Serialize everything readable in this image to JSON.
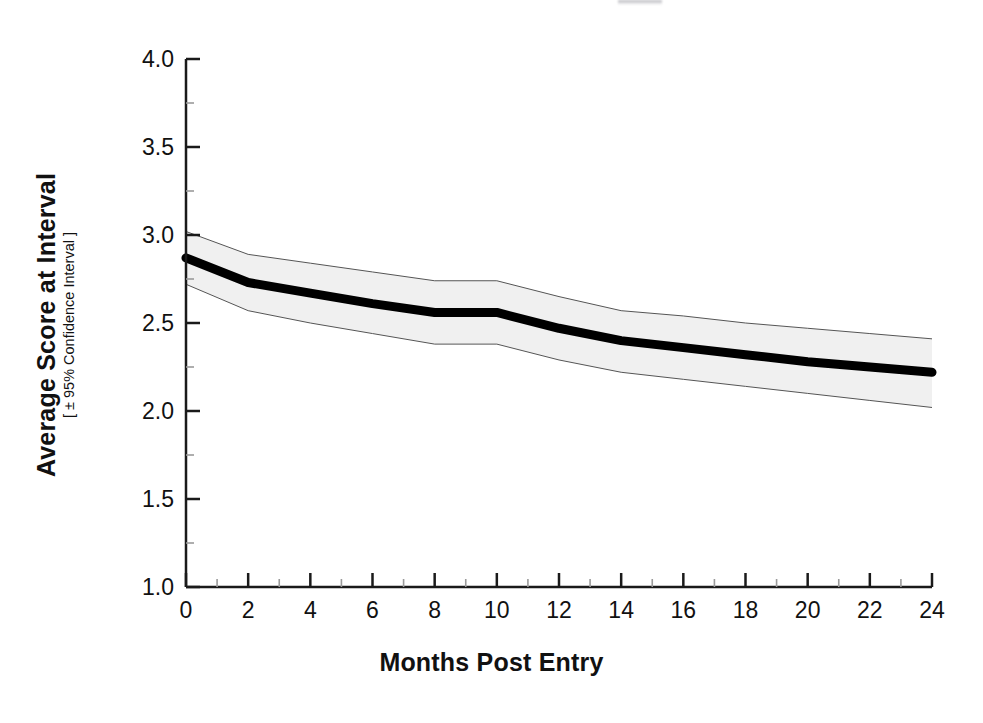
{
  "chart_data": {
    "type": "line",
    "title": "",
    "xlabel": "Months Post Entry",
    "ylabel": "Average Score at Interval",
    "ylabel_sub": "[ ± 95% Confidence Interval ]",
    "xlim": [
      0,
      24
    ],
    "ylim": [
      1.0,
      4.0
    ],
    "xticks": [
      0,
      2,
      4,
      6,
      8,
      10,
      12,
      14,
      16,
      18,
      20,
      22,
      24
    ],
    "xtick_labels": [
      "0",
      "2",
      "4",
      "6",
      "8",
      "10",
      "12",
      "14",
      "16",
      "18",
      "20",
      "22",
      "24"
    ],
    "x_minor_ticks": [
      1,
      3,
      5,
      7,
      9,
      11,
      13,
      15,
      17,
      19,
      21,
      23
    ],
    "yticks": [
      1.0,
      1.5,
      2.0,
      2.5,
      3.0,
      3.5,
      4.0
    ],
    "ytick_labels": [
      "1.0",
      "1.5",
      "2.0",
      "2.5",
      "3.0",
      "3.5",
      "4.0"
    ],
    "y_minor_ticks": [
      1.25,
      1.75,
      2.25,
      2.75,
      3.25,
      3.75
    ],
    "grid": false,
    "legend": false,
    "x": [
      0,
      2,
      4,
      6,
      8,
      10,
      12,
      14,
      16,
      18,
      20,
      22,
      24
    ],
    "series": [
      {
        "name": "Average Score at Interval",
        "style": "thick-black-line",
        "color": "#000000",
        "linewidth": 9,
        "values": [
          2.87,
          2.73,
          2.67,
          2.61,
          2.56,
          2.56,
          2.47,
          2.4,
          2.36,
          2.32,
          2.28,
          2.25,
          2.22
        ]
      },
      {
        "name": "Upper 95% Confidence Limit",
        "style": "band-edge",
        "color": "#555555",
        "linewidth": 1,
        "values": [
          3.02,
          2.89,
          2.84,
          2.79,
          2.74,
          2.74,
          2.65,
          2.57,
          2.54,
          2.5,
          2.47,
          2.44,
          2.41
        ]
      },
      {
        "name": "Lower 95% Confidence Limit",
        "style": "band-edge",
        "color": "#555555",
        "linewidth": 1,
        "values": [
          2.72,
          2.57,
          2.5,
          2.44,
          2.38,
          2.38,
          2.29,
          2.22,
          2.18,
          2.14,
          2.1,
          2.06,
          2.02
        ]
      }
    ],
    "band": {
      "name": "95% Confidence Interval Band",
      "fill_color": "#f0f0f0",
      "edge_color": "#555555",
      "between": [
        "Upper 95% Confidence Limit",
        "Lower 95% Confidence Limit"
      ]
    },
    "axis_color": "#1a1a1a",
    "background_color": "#ffffff"
  }
}
